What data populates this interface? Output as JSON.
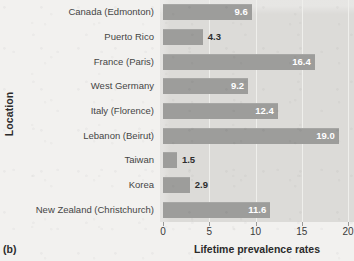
{
  "figure": {
    "panel_letter": "(b)",
    "ylabel": "Location",
    "xlabel": "Lifetime prevalence rates"
  },
  "chart_data": {
    "type": "bar",
    "orientation": "horizontal",
    "title": "",
    "subtitle": "",
    "xlabel": "Lifetime prevalence rates",
    "ylabel": "Location",
    "xlim": [
      0,
      20
    ],
    "ylim": null,
    "grid": true,
    "grid_axis": "x",
    "legend": false,
    "legend_position": "none",
    "xticks": [
      0,
      5,
      10,
      15,
      20
    ],
    "xtick_labels": [
      "0",
      "5",
      "10",
      "15",
      "20"
    ],
    "categories": [
      "Canada (Edmonton)",
      "Puerto Rico",
      "France (Paris)",
      "West Germany",
      "Italy (Florence)",
      "Lebanon (Beirut)",
      "Taiwan",
      "Korea",
      "New Zealand (Christchurch)"
    ],
    "values": [
      9.6,
      4.3,
      16.4,
      9.2,
      12.4,
      19.0,
      1.5,
      2.9,
      11.6
    ],
    "value_labels": [
      "9.6",
      "4.3",
      "16.4",
      "9.2",
      "12.4",
      "19.0",
      "1.5",
      "2.9",
      "11.6"
    ],
    "label_placement": [
      "inside",
      "outside",
      "inside",
      "inside",
      "inside",
      "inside",
      "outside",
      "outside",
      "inside"
    ]
  },
  "colors": {
    "page_background": "#f2f1ef",
    "plot_background": "#dcdbd8",
    "bar_fill": "#9d9d9b",
    "gridline": "#efefec",
    "inside_label_text": "#ffffff",
    "outside_label_text": "#2e2e2e",
    "axis_text": "#3a3a3a",
    "category_text": "#454545",
    "axis_title_text": "#2b2b2b"
  }
}
